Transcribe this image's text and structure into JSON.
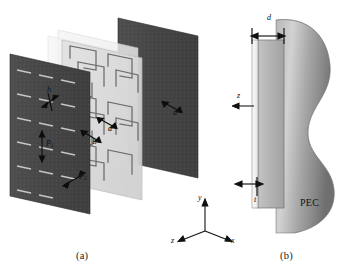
{
  "figure": {
    "type": "technical-diagram",
    "background_color": "#ffffff"
  },
  "panels": [
    {
      "id": "a",
      "caption": "(a)",
      "kind": "exploded-isometric-view",
      "layers": [
        {
          "name": "front-slot-screen",
          "style": "opaque-dark-gray",
          "color": "#4a4a4a",
          "pattern": "dipole-slot-array"
        },
        {
          "name": "middle-fss-screen",
          "style": "translucent-light",
          "color": "#d8d8d8",
          "pattern": "meander-line-fss"
        },
        {
          "name": "dielectric-spacer-1",
          "style": "translucent-pale",
          "color": "#ececec",
          "pattern": "none"
        },
        {
          "name": "dielectric-spacer-2",
          "style": "translucent-pale",
          "color": "#f1f1f1",
          "pattern": "none"
        },
        {
          "name": "back-ground-plane",
          "style": "opaque-dark-gray",
          "color": "#4a4a4a",
          "pattern": "none"
        }
      ],
      "dimension_labels": [
        {
          "id": "h",
          "text": "h",
          "sub": "",
          "meaning": "slot width"
        },
        {
          "id": "L",
          "text": "L",
          "sub": "",
          "meaning": "element length"
        },
        {
          "id": "P1",
          "text": "P",
          "sub": "1",
          "meaning": "vertical periodicity"
        },
        {
          "id": "P2",
          "text": "P",
          "sub": "2",
          "meaning": "horizontal periodicity"
        },
        {
          "id": "d",
          "text": "d",
          "sub": "",
          "meaning": "layer separation"
        }
      ],
      "axes": {
        "x": "x",
        "y": "y",
        "z": "z"
      }
    },
    {
      "id": "b",
      "caption": "(b)",
      "kind": "side-view",
      "labels": [
        {
          "id": "d",
          "text": "d",
          "meaning": "slab thickness"
        },
        {
          "id": "t",
          "text": "t",
          "meaning": "sheet thickness"
        },
        {
          "id": "z",
          "text": "z",
          "meaning": "propagation axis"
        },
        {
          "id": "pec",
          "text": "PEC",
          "meaning": "perfect electric conductor backing"
        }
      ],
      "surface": {
        "name": "curved-pec-body",
        "shading": "gray-gradient",
        "color": "#9a9a9a"
      }
    }
  ],
  "colors": {
    "dark_panel": "#4a4a4a",
    "light_panel": "#d9d9d9",
    "pale_panel": "#efefef",
    "slot_fill": "#c9c9c9",
    "trace": "#5a5a5a",
    "pec_gray": "#949494",
    "slab_gray": "#b0b0b0",
    "ink": "#111111"
  }
}
